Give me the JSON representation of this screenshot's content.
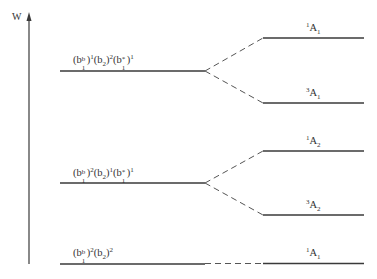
{
  "diagram": {
    "axis": {
      "label": "W"
    },
    "configurations": [
      {
        "id": "c1",
        "label_parts": {
          "b1b_exp": "1",
          "b2_exp": "2",
          "b1star_exp": "1"
        }
      },
      {
        "id": "c2",
        "label_parts": {
          "b1b_exp": "2",
          "b2_exp": "1",
          "b1star_exp": "1"
        }
      },
      {
        "id": "c3",
        "label_parts": {
          "b1b_exp": "2",
          "b2_exp": "2"
        }
      }
    ],
    "states": [
      {
        "id": "s1",
        "mult": "1",
        "sym": "A",
        "sub": "1"
      },
      {
        "id": "s2",
        "mult": "3",
        "sym": "A",
        "sub": "1"
      },
      {
        "id": "s3",
        "mult": "1",
        "sym": "A",
        "sub": "2"
      },
      {
        "id": "s4",
        "mult": "3",
        "sym": "A",
        "sub": "2"
      },
      {
        "id": "s5",
        "mult": "1",
        "sym": "A",
        "sub": "1"
      }
    ],
    "symbols": {
      "b": "b",
      "b_sub": "1",
      "b_sup": "b",
      "b2_sub": "2",
      "star": "*",
      "open": "(",
      "close": ")"
    },
    "colors": {
      "line": "#3a3a3a"
    }
  }
}
